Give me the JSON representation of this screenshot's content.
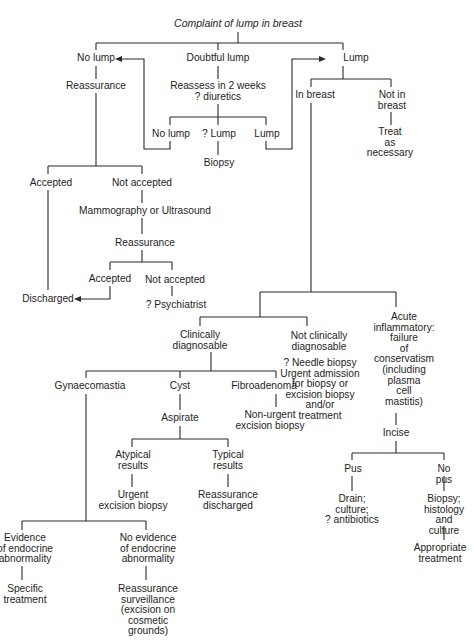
{
  "figure": {
    "running_head": "",
    "title": "Complaint of lump in breast",
    "nodes": {
      "no_lump": "No lump",
      "doubtful_lump": "Doubtful lump",
      "lump": "Lump",
      "reassurance_1": "Reassurance",
      "reassess": "Reassess in 2 weeks\n? diuretics",
      "in_breast": "In breast",
      "not_in_breast": "Not in\nbreast",
      "treat_as_necessary": "Treat\nas\nnecessary",
      "reassess_no_lump": "No lump",
      "reassess_q_lump": "? Lump",
      "reassess_lump": "Lump",
      "biopsy": "Biopsy",
      "accepted_1": "Accepted",
      "not_accepted_1": "Not accepted",
      "mammography": "Mammography or Ultrasound",
      "reassurance_2": "Reassurance",
      "accepted_2": "Accepted",
      "not_accepted_2": "Not accepted",
      "discharged": "Discharged",
      "psychiatrist": "? Psychiatrist",
      "clinically_diagnosable": "Clinically\ndiagnosable",
      "not_clinically_diagnosable": "Not clinically\ndiagnosable",
      "needle_biopsy": "? Needle biopsy\nUrgent admission\nfor biopsy or\nexcision biopsy\nand/or\ntreatment",
      "acute_inflammatory": "Acute\ninflammatory:\nfailure\nof\nconservatism\n(including\nplasma\ncell\nmastitis)",
      "gynaecomastia": "Gynaecomastia",
      "cyst": "Cyst",
      "fibroadenoma": "Fibroadenoma",
      "non_urgent_excision": "Non-urgent\nexcision biopsy",
      "aspirate": "Aspirate",
      "atypical_results": "Atypical\nresults",
      "typical_results": "Typical\nresults",
      "urgent_excision": "Urgent\nexcision biopsy",
      "reassurance_discharged": "Reassurance\ndischarged",
      "incise": "Incise",
      "pus": "Pus",
      "no_pus": "No pus",
      "drain": "Drain;\nculture;\n? antibiotics",
      "biopsy_histology": "Biopsy;\nhistology\nand culture",
      "appropriate_treatment": "Appropriate\ntreatment",
      "evidence_endocrine": "Evidence\nof endocrine\nabnormality",
      "no_evidence_endocrine": "No evidence\nof endocrine\nabnormality",
      "specific_treatment": "Specific\ntreatment",
      "reassurance_surveillance": "Reassurance\nsurveillance\n(excision on\ncosmetic\ngrounds)"
    }
  }
}
